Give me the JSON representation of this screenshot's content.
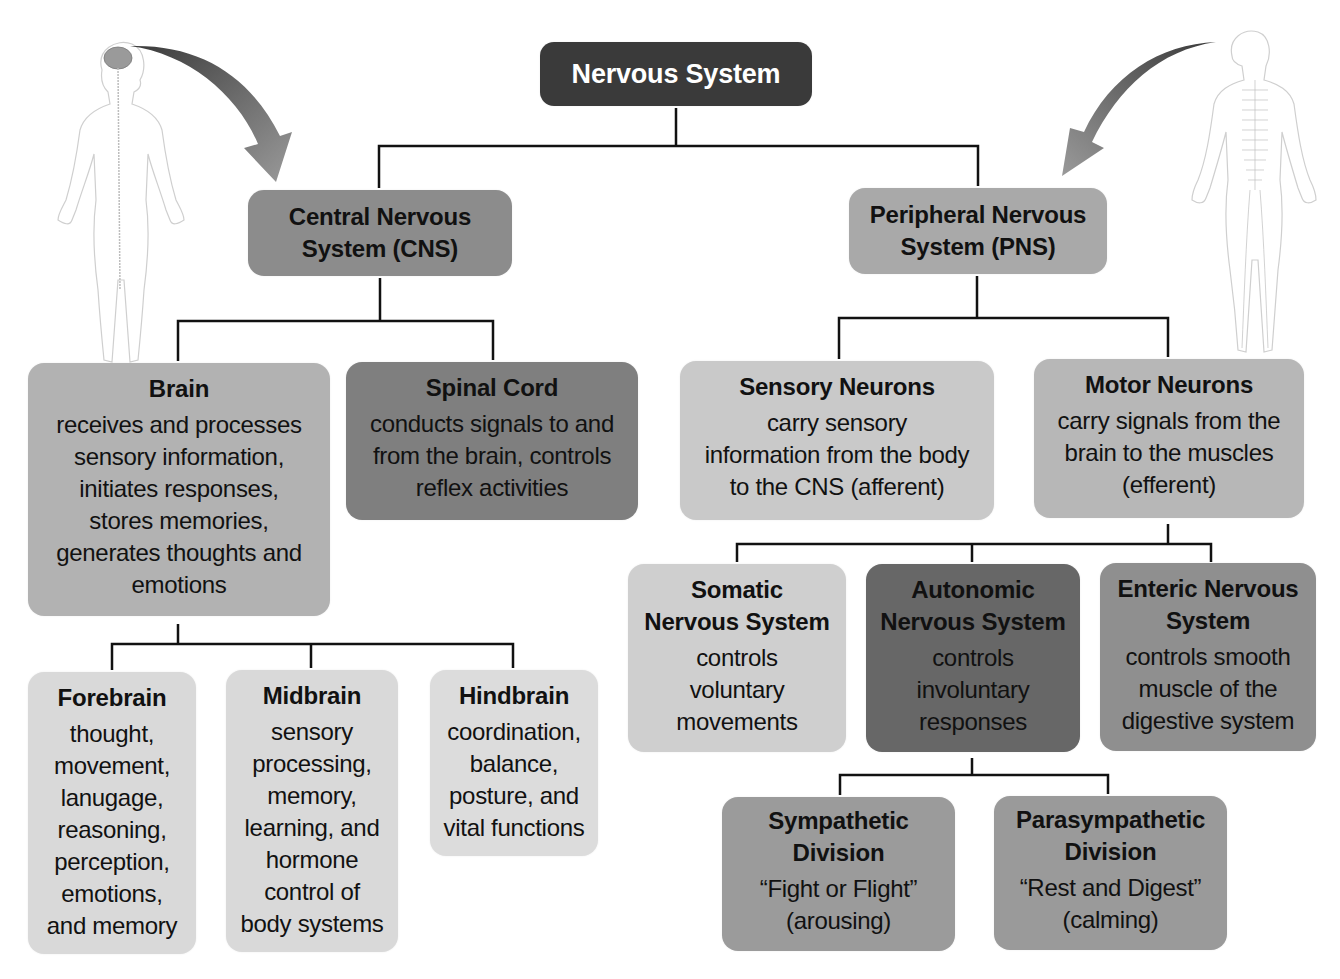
{
  "diagram": {
    "type": "hierarchy",
    "root": {
      "title": "Nervous System",
      "color": "#3a3a3a",
      "text_color": "#ffffff"
    },
    "cns": {
      "title": "Central Nervous\nSystem (CNS)",
      "color": "#8c8c8c",
      "children": {
        "brain": {
          "title": "Brain",
          "desc": "receives and processes\nsensory information,\ninitiates responses,\nstores memories,\ngenerates thoughts and\nemotions",
          "color": "#b2b2b2",
          "children": {
            "forebrain": {
              "title": "Forebrain",
              "desc": "thought,\nmovement,\nlanugage,\nreasoning,\nperception,\nemotions,\nand memory",
              "color": "#d9d9d9"
            },
            "midbrain": {
              "title": "Midbrain",
              "desc": "sensory\nprocessing,\nmemory,\nlearning, and\nhormone\ncontrol of\nbody systems",
              "color": "#d9d9d9"
            },
            "hindbrain": {
              "title": "Hindbrain",
              "desc": "coordination,\nbalance,\nposture, and\nvital functions",
              "color": "#dcdcdc"
            }
          }
        },
        "spinal_cord": {
          "title": "Spinal Cord",
          "desc": "conducts signals to and\nfrom the brain, controls\nreflex activities",
          "color": "#7f7f7f"
        }
      }
    },
    "pns": {
      "title": "Peripheral Nervous\nSystem (PNS)",
      "color": "#a9a9a9",
      "children": {
        "sensory": {
          "title": "Sensory Neurons",
          "desc": "carry sensory\ninformation from the body\nto the CNS (afferent)",
          "color": "#c9c9c9"
        },
        "motor": {
          "title": "Motor Neurons",
          "desc": "carry signals from the\nbrain to the muscles\n(efferent)",
          "color": "#b7b7b7",
          "children": {
            "somatic": {
              "title": "Somatic\nNervous System",
              "desc": "controls\nvoluntary\nmovements",
              "color": "#cfcfcf"
            },
            "autonomic": {
              "title": "Autonomic\nNervous System",
              "desc": "controls\ninvoluntary\nresponses",
              "color": "#676767",
              "children": {
                "sympathetic": {
                  "title": "Sympathetic\nDivision",
                  "desc": "“Fight or Flight”\n(arousing)",
                  "color": "#9b9b9b"
                },
                "parasympathetic": {
                  "title": "Parasympathetic\nDivision",
                  "desc": "“Rest and Digest”\n(calming)",
                  "color": "#9a9a9a"
                }
              }
            },
            "enteric": {
              "title": "Enteric Nervous\nSystem",
              "desc": "controls smooth\nmuscle of the\ndigestive system",
              "color": "#8f8f8f"
            }
          }
        }
      }
    },
    "illustrations": {
      "left": "human-figure-brain-spinal-cord",
      "right": "human-figure-peripheral-nerves"
    },
    "connector_color": "#111111",
    "arrow_color": "#6e6e6e"
  }
}
